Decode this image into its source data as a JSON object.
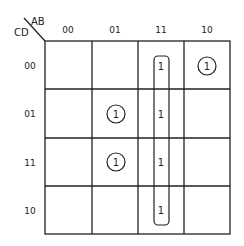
{
  "corner": {
    "ab_label": "AB",
    "cd_label": "CD"
  },
  "columns": [
    "00",
    "01",
    "11",
    "10"
  ],
  "rows": [
    "00",
    "01",
    "11",
    "10"
  ],
  "cells": [
    [
      "",
      "",
      "1",
      "1"
    ],
    [
      "",
      "1",
      "1",
      ""
    ],
    [
      "",
      "1",
      "1",
      ""
    ],
    [
      "",
      "",
      "1",
      ""
    ]
  ],
  "circled": [
    [
      0,
      3
    ],
    [
      1,
      1
    ],
    [
      2,
      1
    ]
  ],
  "groups": [
    {
      "name": "column-11-group",
      "column": 2,
      "rows": [
        0,
        1,
        2,
        3
      ]
    }
  ]
}
